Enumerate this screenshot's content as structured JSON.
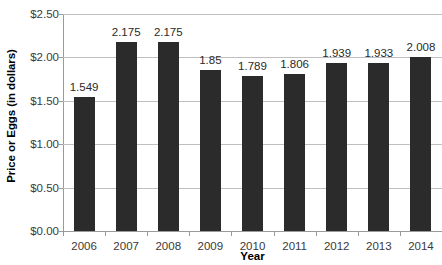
{
  "chart_data": {
    "type": "bar",
    "title": "",
    "xlabel": "Year",
    "ylabel": "Price or Eggs (in dollars)",
    "categories": [
      "2006",
      "2007",
      "2008",
      "2009",
      "2010",
      "2011",
      "2012",
      "2013",
      "2014"
    ],
    "values": [
      1.549,
      2.175,
      2.175,
      1.85,
      1.789,
      1.806,
      1.939,
      1.933,
      2.008
    ],
    "value_labels": [
      "1.549",
      "2.175",
      "2.175",
      "1.85",
      "1.789",
      "1.806",
      "1.939",
      "1.933",
      "2.008"
    ],
    "ylim": [
      0,
      2.5
    ],
    "ytick_values": [
      0,
      0.5,
      1.0,
      1.5,
      2.0,
      2.5
    ],
    "ytick_labels": [
      "$0.00",
      "$0.50",
      "$1.00",
      "$1.50",
      "$2.00",
      "$2.50"
    ],
    "grid": true,
    "legend": null,
    "bar_color": "#2b2b2b",
    "gridline_color": "#bfbfbf",
    "axis_color": "#9a9a9a",
    "background_color": "#ffffff"
  }
}
